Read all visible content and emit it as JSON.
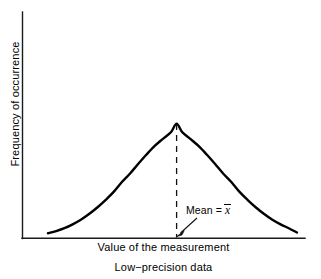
{
  "figure": {
    "caption": "Low−precision data",
    "background_color": "#ffffff",
    "ink_color": "#000000"
  },
  "axes": {
    "y_label": "Frequency of occurrence",
    "x_label": "Value of the measurement"
  },
  "annotations": {
    "mean": {
      "label_prefix": "Mean = ",
      "variable": "x",
      "notation": "x-bar",
      "full_text": "Mean = x̄"
    }
  },
  "chart_data": {
    "type": "line",
    "title": "",
    "subtitle": "",
    "xlabel": "Value of the measurement",
    "ylabel": "Frequency of occurrence",
    "caption": "Low−precision data",
    "grid": false,
    "legend": false,
    "axis_ticks": false,
    "tick_labels": [],
    "curve_description": "Broad, low, symmetric normal (Gaussian) distribution indicating low precision / large spread",
    "distribution": {
      "shape": "gaussian",
      "mean_x": 0.0,
      "std_dev_x": 0.265,
      "peak_height": 1.0,
      "symmetric": true,
      "relative_width": "wide"
    },
    "xlim": [
      -0.47,
      0.44
    ],
    "ylim": [
      0.0,
      1.08
    ],
    "series": [
      {
        "name": "Low-precision distribution",
        "color": "#000000",
        "line_width": 2.4,
        "x": [
          -0.47,
          -0.44,
          -0.41,
          -0.38,
          -0.35,
          -0.32,
          -0.29,
          -0.26,
          -0.23,
          -0.2,
          -0.17,
          -0.14,
          -0.11,
          -0.08,
          -0.05,
          -0.02,
          0.0,
          0.02,
          0.05,
          0.08,
          0.11,
          0.14,
          0.17,
          0.2,
          0.23,
          0.26,
          0.29,
          0.32,
          0.35,
          0.38,
          0.41,
          0.44
        ],
        "y": [
          0.043,
          0.062,
          0.087,
          0.121,
          0.161,
          0.211,
          0.268,
          0.333,
          0.404,
          0.49,
          0.565,
          0.649,
          0.73,
          0.805,
          0.867,
          0.927,
          1.0,
          0.927,
          0.867,
          0.805,
          0.73,
          0.649,
          0.565,
          0.49,
          0.404,
          0.333,
          0.268,
          0.211,
          0.161,
          0.121,
          0.087,
          0.05
        ]
      }
    ],
    "annotations": [
      {
        "type": "vline",
        "name": "mean-line",
        "x": 0.0,
        "y_from": 0.0,
        "y_to": 1.0,
        "style": "dashed",
        "color": "#000000"
      },
      {
        "type": "arrow-label",
        "name": "mean-label",
        "text": "Mean = x̄",
        "points_to_x": 0.0,
        "points_to_y": 0.0
      }
    ]
  }
}
